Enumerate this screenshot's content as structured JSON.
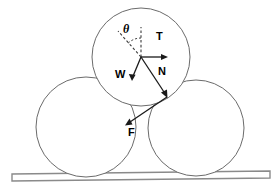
{
  "diagram": {
    "background_color": "#ffffff",
    "stroke_color": "#6b6b6b",
    "vector_color": "#1a1a1a",
    "circles": [
      {
        "name": "top-cylinder",
        "cx": 141,
        "cy": 57,
        "r": 49
      },
      {
        "name": "left-cylinder",
        "cx": 86,
        "cy": 127,
        "r": 50
      },
      {
        "name": "right-cylinder",
        "cx": 196,
        "cy": 128,
        "r": 48
      }
    ],
    "ground": {
      "name": "plank",
      "x_left": 12,
      "x_right": 270,
      "y_top_left": 174,
      "y_top_right": 171,
      "thickness": 7
    },
    "origin": {
      "x": 141,
      "y": 57
    },
    "contact_point": {
      "x": 167,
      "y": 97
    },
    "vectors": [
      {
        "label": "T",
        "name": "tension-vector",
        "x1": 141,
        "y1": 57,
        "x2": 167,
        "y2": 57,
        "label_x": 156,
        "label_y": 33
      },
      {
        "label": "W",
        "name": "weight-vector",
        "x1": 141,
        "y1": 57,
        "x2": 133,
        "y2": 80,
        "label_x": 116,
        "label_y": 69
      },
      {
        "label": "N",
        "name": "normal-force-vector",
        "x1": 141,
        "y1": 57,
        "x2": 167,
        "y2": 97,
        "label_x": 159,
        "label_y": 67
      },
      {
        "label": "F",
        "name": "friction-force-vector",
        "x1": 167,
        "y1": 97,
        "x2": 126,
        "y2": 125,
        "label_x": 129,
        "label_y": 130
      }
    ],
    "angle": {
      "symbol": "θ",
      "name": "theta-angle",
      "label_x": 126,
      "label_y": 26,
      "vertical_ref": {
        "x1": 141,
        "y1": 57,
        "x2": 141,
        "y2": 28
      },
      "diagonal_ref": {
        "x1": 141,
        "y1": 57,
        "x2": 119,
        "y2": 32
      },
      "arc_radius": 19
    }
  }
}
